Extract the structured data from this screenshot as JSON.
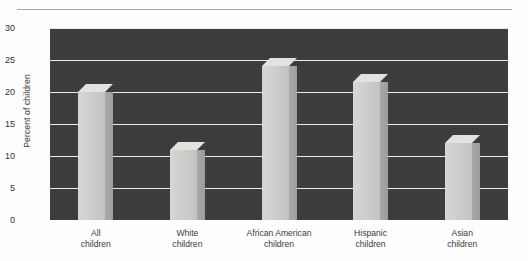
{
  "chart_data": {
    "type": "bar",
    "title": "",
    "xlabel": "",
    "ylabel": "Percent of children",
    "categories": [
      "All children",
      "White children",
      "African American children",
      "Hispanic children",
      "Asian children"
    ],
    "category_lines": [
      [
        "All",
        "children"
      ],
      [
        "White",
        "children"
      ],
      [
        "African American",
        "children"
      ],
      [
        "Hispanic",
        "children"
      ],
      [
        "Asian",
        "children"
      ]
    ],
    "values": [
      20,
      11,
      24,
      21.5,
      12
    ],
    "ylim": [
      0,
      30
    ],
    "yticks": [
      0,
      5,
      10,
      15,
      20,
      25,
      30
    ],
    "ytick_labels": [
      "0",
      "5",
      "10",
      "15",
      "20",
      "25",
      "30"
    ],
    "grid": true,
    "legend": "none",
    "style": {
      "plot_background": "#3b3b3b",
      "gridline_color": "#e9e9e9",
      "bar_face_color": "#cfcfcd",
      "bar_side_color": "#a0a09e",
      "bar_top_color": "#e2e2df",
      "three_d": true,
      "page_background": "#fdfdfd",
      "text_color": "#3b3b3b"
    }
  },
  "figure": {
    "top_rule": "",
    "bottom_caption": ""
  }
}
